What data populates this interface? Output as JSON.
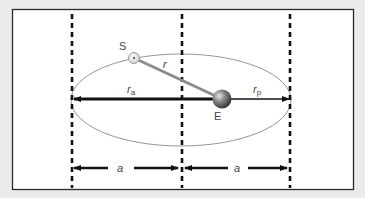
{
  "diagram": {
    "colors": {
      "background": "#ebebeb",
      "frame_fill": "#ffffff",
      "frame_stroke": "#2a2a2a",
      "ellipse_stroke": "#8a8a8a",
      "dashed_line": "#111111",
      "arrow": "#111111",
      "radius_line": "#8c8c8c",
      "text": "#444444"
    },
    "labels": {
      "sun": "S",
      "earth": "E",
      "radius": "r",
      "aphelion_radius_main": "r",
      "aphelion_radius_sub": "a",
      "perihelion_radius_main": "r",
      "perihelion_radius_sub": "p",
      "semi_major_left": "a",
      "semi_major_right": "a"
    },
    "bodies": [
      {
        "name": "S",
        "role": "satellite / moving body",
        "x": 134,
        "y": 58
      },
      {
        "name": "E",
        "role": "central body at focus",
        "x": 222,
        "y": 99
      }
    ],
    "guides": {
      "dashed_x": [
        72,
        182,
        290
      ]
    }
  }
}
